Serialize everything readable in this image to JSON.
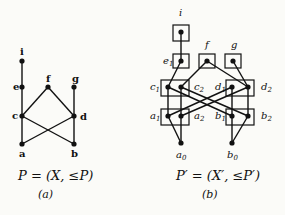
{
  "figure_a": {
    "caption": "P = (X, ≤P)",
    "sublabel": "(a)",
    "nodes": [
      {
        "id": "i",
        "label": "i",
        "x": 22,
        "y": 61,
        "lx": 20,
        "ly": 55
      },
      {
        "id": "e",
        "label": "e",
        "x": 22,
        "y": 87,
        "lx": 13,
        "ly": 90
      },
      {
        "id": "f",
        "label": "f",
        "x": 48,
        "y": 87,
        "lx": 46,
        "ly": 82
      },
      {
        "id": "g",
        "label": "g",
        "x": 74,
        "y": 87,
        "lx": 72,
        "ly": 82
      },
      {
        "id": "c",
        "label": "c",
        "x": 22,
        "y": 116,
        "lx": 13,
        "ly": 119
      },
      {
        "id": "d",
        "label": "d",
        "x": 74,
        "y": 116,
        "lx": 80,
        "ly": 119
      },
      {
        "id": "a",
        "label": "a",
        "x": 22,
        "y": 144,
        "lx": 19,
        "ly": 157
      },
      {
        "id": "b",
        "label": "b",
        "x": 74,
        "y": 144,
        "lx": 71,
        "ly": 157
      }
    ],
    "edges": [
      [
        "i",
        "e"
      ],
      [
        "e",
        "c"
      ],
      [
        "f",
        "c"
      ],
      [
        "f",
        "d"
      ],
      [
        "g",
        "d"
      ],
      [
        "c",
        "a"
      ],
      [
        "c",
        "b"
      ],
      [
        "d",
        "a"
      ],
      [
        "d",
        "b"
      ]
    ]
  },
  "figure_b": {
    "caption": "P′ = (X′, ≤P′)",
    "sublabel": "(b)",
    "top_labels": [
      {
        "text": "i",
        "x": 179,
        "y": 16
      },
      {
        "text": "f",
        "x": 205,
        "y": 46
      },
      {
        "text": "g",
        "x": 231,
        "y": 46
      }
    ],
    "side_labels": [
      {
        "text": "e1",
        "x": 164,
        "y": 64
      },
      {
        "text": "c1",
        "x": 148,
        "y": 90
      },
      {
        "text": "c2",
        "x": 194,
        "y": 90
      },
      {
        "text": "d1",
        "x": 218,
        "y": 90
      },
      {
        "text": "d2",
        "x": 262,
        "y": 90
      },
      {
        "text": "a1",
        "x": 148,
        "y": 119
      },
      {
        "text": "a2",
        "x": 194,
        "y": 119
      },
      {
        "text": "b1",
        "x": 218,
        "y": 119
      },
      {
        "text": "b2",
        "x": 262,
        "y": 119
      },
      {
        "text": "a0",
        "x": 176,
        "y": 158
      },
      {
        "text": "b0",
        "x": 227,
        "y": 158
      }
    ]
  }
}
